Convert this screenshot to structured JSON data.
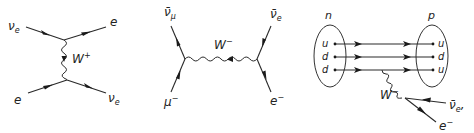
{
  "diagrams": [
    {
      "name": "neutrino-electron-scattering",
      "labels": {
        "in_top": {
          "base": "ν",
          "sub": "e"
        },
        "out_top": {
          "base": "e"
        },
        "boson": {
          "base": "W",
          "sup": "+"
        },
        "in_bottom": {
          "base": "e"
        },
        "out_bottom": {
          "base": "ν",
          "sub": "e"
        }
      }
    },
    {
      "name": "muon-decay",
      "labels": {
        "top_left": {
          "base": "ν̄",
          "sub": "μ"
        },
        "bottom_left": {
          "base": "μ",
          "sup": "−"
        },
        "boson": {
          "base": "W",
          "sup": "−"
        },
        "top_right": {
          "base": "ν̄",
          "sub": "e"
        },
        "bottom_right": {
          "base": "e",
          "sup": "−"
        }
      }
    },
    {
      "name": "neutron-beta-decay",
      "labels": {
        "initial": "n",
        "final": "p",
        "initial_quarks": [
          "u",
          "d",
          "d"
        ],
        "final_quarks": [
          "u",
          "d",
          "u"
        ],
        "boson": {
          "base": "W",
          "sup": "−"
        },
        "antineutrino": {
          "base": "ν̄",
          "sub": "e",
          "suffix": ","
        },
        "electron": {
          "base": "e",
          "sup": "−"
        }
      }
    }
  ]
}
